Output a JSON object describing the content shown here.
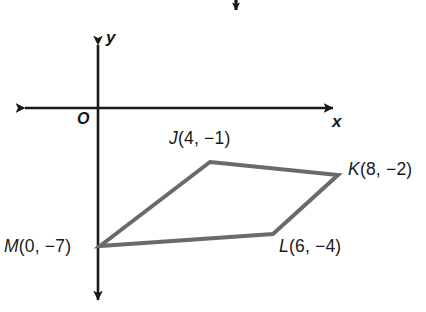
{
  "figure": {
    "background_color": "#ffffff",
    "axis_color": "#1a1a1a",
    "polygon_color": "#6a6a6a",
    "text_color": "#1a1a1a"
  },
  "axes": {
    "x_label": "x",
    "y_label": "y",
    "origin_label": "O"
  },
  "annotation": {
    "down_arrow": "down-arrow"
  },
  "chart_data": {
    "type": "scatter",
    "title": "",
    "xlabel": "x",
    "ylabel": "y",
    "grid": false,
    "legend": "none",
    "xlim": [
      -4,
      11
    ],
    "ylim": [
      -9,
      3
    ],
    "shape": "quadrilateral",
    "closed": true,
    "points": [
      {
        "name": "J",
        "x": 4,
        "y": -1,
        "label": "J(4,  −1)"
      },
      {
        "name": "K",
        "x": 8,
        "y": -2,
        "label": "K(8,  −2)"
      },
      {
        "name": "L",
        "x": 6,
        "y": -4,
        "label": "L(6,  −4)"
      },
      {
        "name": "M",
        "x": 0,
        "y": -7,
        "label": "M(0,  −7)"
      }
    ],
    "edges": [
      [
        "J",
        "K"
      ],
      [
        "K",
        "L"
      ],
      [
        "L",
        "M"
      ],
      [
        "M",
        "J"
      ]
    ]
  }
}
